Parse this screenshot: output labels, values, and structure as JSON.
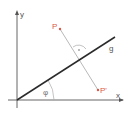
{
  "diagram": {
    "type": "geometry-reflection",
    "axes": {
      "x_label": "x",
      "y_label": "y"
    },
    "line": {
      "label": "g"
    },
    "angle": {
      "label": "φ"
    },
    "points": [
      {
        "name": "P",
        "label": "P"
      },
      {
        "name": "P-prime",
        "label": "P'"
      }
    ],
    "colors": {
      "axes": "#555555",
      "line_g": "#2b2b2b",
      "points": "#d9584a",
      "perpendicular": "#999999",
      "arc": "#9a9a9a"
    }
  }
}
